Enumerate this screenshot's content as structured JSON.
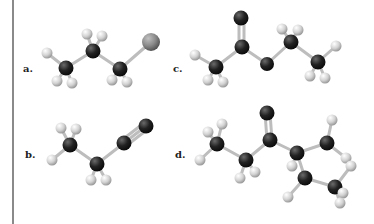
{
  "figure": {
    "labels": {
      "a": "a.",
      "b": "b.",
      "c": "c.",
      "d": "d."
    },
    "colors": {
      "carbon": "#2a2a2a",
      "hydrogen": "#d8d8d8",
      "oxygen": "#2e2e2e",
      "halogen": "#8e8e8e",
      "bond": "#bdbdbd",
      "border": "#8a8a8a"
    },
    "molecules": [
      {
        "id": "a",
        "description": "ball-and-stick model: 1-halopropane"
      },
      {
        "id": "b",
        "description": "ball-and-stick model: propanenitrile"
      },
      {
        "id": "c",
        "description": "ball-and-stick model: ethyl acetate"
      },
      {
        "id": "d",
        "description": "ball-and-stick model: cyclopentyl ethyl ketone"
      }
    ]
  }
}
